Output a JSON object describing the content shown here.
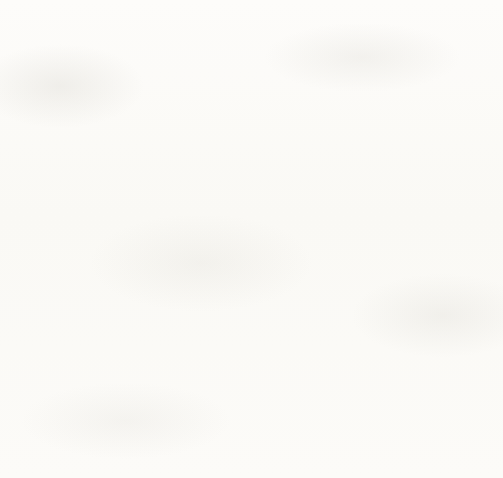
{
  "chart_data": {
    "type": "bar",
    "subtype": "stacked-vertical",
    "title": "",
    "xlabel": "",
    "ylabel": "",
    "ylim": [
      0,
      25000
    ],
    "y_ticks": [
      0,
      5000,
      10000,
      15000,
      20000,
      25000
    ],
    "y_tick_labels": [
      "USD 0",
      "USD 5,000",
      "USD 10,000",
      "USD 15,000",
      "USD 20,000",
      "USD 25,000"
    ],
    "grid": "horizontal",
    "legend_position": "top-center",
    "currency": "USD",
    "categories": [
      "London LHR",
      "Toronto",
      "Johannesburg",
      "Rome FCO",
      "Sydney",
      "Sao Paolo GRU",
      "Mexico City",
      "New York JFK",
      "Amsterdam",
      "Cairo",
      "Dallas / Fort Worth",
      "Beijing",
      "Singapore",
      "Doha",
      "Moscow SVO",
      "Delhi"
    ],
    "series": [
      {
        "name": "Aircraft-related",
        "color": "#3b332f",
        "values": [
          4300,
          10100,
          13500,
          4900,
          4000,
          5100,
          2000,
          3900,
          1300,
          2200,
          2900,
          5400,
          2900,
          1300,
          6500,
          3700
        ]
      },
      {
        "name": "Passenger-related",
        "color": "#7b7a76",
        "values": [
          18200,
          11100,
          5200,
          11800,
          12200,
          9900,
          12200,
          8900,
          11000,
          7800,
          6700,
          4100,
          6500,
          7700,
          2300,
          600
        ]
      }
    ],
    "totals": [
      22500,
      21200,
      18700,
      16700,
      16200,
      15000,
      14200,
      12800,
      12300,
      10000,
      9600,
      9500,
      9400,
      9000,
      8800,
      4300
    ]
  },
  "legend": {
    "items": [
      {
        "label": "Aircraft-related",
        "swatch": "dark-square-icon"
      },
      {
        "label": "Passenger-related",
        "swatch": "gray-square-icon"
      }
    ]
  }
}
